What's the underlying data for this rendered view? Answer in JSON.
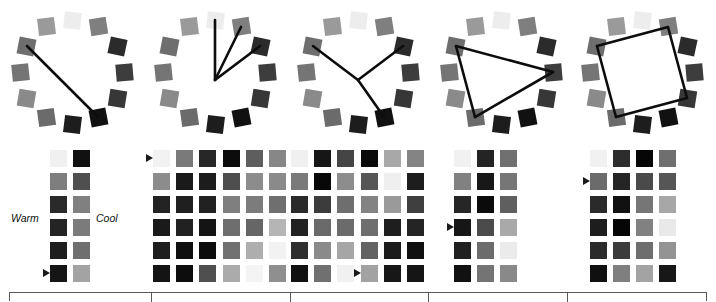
{
  "figure": {
    "background": "#ffffff",
    "line_color": "#0d0d0d",
    "marker_color": "#1a1a1a",
    "table_border_color": "#58585a"
  },
  "labels": {
    "warm": "Warm",
    "cool": "Cool"
  },
  "chart_data": {
    "type": "table",
    "panels": [
      {
        "name": "panel-1-complementary",
        "x": 0,
        "dial": {
          "center_x": 72,
          "center_y": 72,
          "radius": 52,
          "swatch_count": 12,
          "swatch_values": [
            "#ededed",
            "#7f7f7f",
            "#2b2b2b",
            "#3d3d3d",
            "#373737",
            "#111111",
            "#1d1d1d",
            "#6b6b6b",
            "#8a8a8a",
            "#757575",
            "#6e6e6e",
            "#9a9a9a"
          ],
          "swatch_rotations": [
            6,
            -9,
            12,
            -5,
            9,
            -11,
            7,
            -8,
            10,
            -6,
            11,
            -7
          ],
          "lines": [
            [
              10,
              5
            ]
          ]
        },
        "groups": [
          {
            "x": 50,
            "cols": 2,
            "rows": 6,
            "values": [
              [
                "#f0f0f0",
                "#111111"
              ],
              [
                "#7e7e7e",
                "#4f4f4f"
              ],
              [
                "#2a2a2a",
                "#808080"
              ],
              [
                "#242424",
                "#7b7b7b"
              ],
              [
                "#1e1e1e",
                "#6f6f6f"
              ],
              [
                "#151515",
                "#a3a3a3"
              ]
            ],
            "marker": {
              "row": 5,
              "col": 0
            }
          }
        ],
        "warm_label_pos": {
          "x": 11,
          "y": 212
        },
        "cool_label_pos": {
          "x": 96,
          "y": 212
        }
      },
      {
        "name": "panel-2-split",
        "x": 143,
        "dial": {
          "center_x": 72,
          "center_y": 72,
          "radius": 52,
          "swatch_count": 12,
          "swatch_values": [
            "#ededed",
            "#7f7f7f",
            "#2b2b2b",
            "#3d3d3d",
            "#373737",
            "#111111",
            "#1d1d1d",
            "#6b6b6b",
            "#8a8a8a",
            "#757575",
            "#6e6e6e",
            "#9a9a9a"
          ],
          "swatch_rotations": [
            6,
            -9,
            12,
            -5,
            9,
            -11,
            7,
            -8,
            10,
            -6,
            11,
            -7
          ],
          "lines": [
            [
              0,
              6
            ],
            [
              1,
              6
            ],
            [
              2,
              6
            ]
          ]
        },
        "groups": [
          {
            "x": 10,
            "cols": 3,
            "rows": 6,
            "values": [
              [
                "#f2f2f2",
                "#7a7a7a",
                "#272727"
              ],
              [
                "#8c8c8c",
                "#1a1a1a",
                "#1c1c1c"
              ],
              [
                "#232323",
                "#1f1f1f",
                "#212121"
              ],
              [
                "#1a1a1a",
                "#212121",
                "#141414"
              ],
              [
                "#1e1e1e",
                "#0f0f0f",
                "#0c0c0c"
              ],
              [
                "#141414",
                "#0d0d0d",
                "#4f4f4f"
              ]
            ],
            "marker": {
              "row": 0,
              "col": 0
            }
          },
          {
            "x": 80,
            "cols": 3,
            "rows": 6,
            "values": [
              [
                "#0c0c0c",
                "#5e5e5e",
                "#878787"
              ],
              [
                "#4e4e4e",
                "#8c8c8c",
                "#8a8a8a"
              ],
              [
                "#7f7f7f",
                "#7c7c7c",
                "#6f6f6f"
              ],
              [
                "#6e6e6e",
                "#666666",
                "#b5b5b5"
              ],
              [
                "#717171",
                "#aeaeae",
                "#f2f2f2"
              ],
              [
                "#ababab",
                "#f4f4f4",
                "#8f8f8f"
              ]
            ],
            "marker": null
          }
        ]
      },
      {
        "name": "panel-3-triad-y",
        "x": 286,
        "dial": {
          "center_x": 72,
          "center_y": 72,
          "radius": 52,
          "swatch_count": 12,
          "swatch_values": [
            "#ededed",
            "#7f7f7f",
            "#2b2b2b",
            "#3d3d3d",
            "#373737",
            "#111111",
            "#1d1d1d",
            "#6b6b6b",
            "#8a8a8a",
            "#757575",
            "#6e6e6e",
            "#9a9a9a"
          ],
          "swatch_rotations": [
            6,
            -9,
            12,
            -5,
            9,
            -11,
            7,
            -8,
            10,
            -6,
            11,
            -7
          ],
          "lines": [
            [
              10,
              95
            ],
            [
              5,
              95
            ],
            [
              2,
              95
            ]
          ]
        },
        "groups": [
          {
            "x": 5,
            "cols": 3,
            "rows": 6,
            "values": [
              [
                "#f0f0f0",
                "#161616",
                "#454545"
              ],
              [
                "#7a7a7a",
                "#080808",
                "#8d8d8d"
              ],
              [
                "#2a2a2a",
                "#3c3c3c",
                "#6e6e6e"
              ],
              [
                "#222222",
                "#6a6a6a",
                "#6b6b6b"
              ],
              [
                "#2e2e2e",
                "#8a8a8a",
                "#a6a6a6"
              ],
              [
                "#111111",
                "#707070",
                "#f1f1f1"
              ]
            ],
            "marker": null
          },
          {
            "x": 75,
            "cols": 3,
            "rows": 6,
            "values": [
              [
                "#0a0a0a",
                "#a8a8a8",
                "#848484"
              ],
              [
                "#565656",
                "#efefef",
                "#1d1d1d"
              ],
              [
                "#838383",
                "#9a9a9a",
                "#3f3f3f"
              ],
              [
                "#6e6e6e",
                "#1e1e1e",
                "#242424"
              ],
              [
                "#636363",
                "#1b1b1b",
                "#101010"
              ],
              [
                "#a2a2a2",
                "#171717",
                "#151515"
              ]
            ],
            "marker": {
              "row": 5,
              "col": 0
            }
          }
        ]
      },
      {
        "name": "panel-4-triangle",
        "x": 429,
        "dial": {
          "center_x": 72,
          "center_y": 72,
          "radius": 52,
          "swatch_count": 12,
          "swatch_values": [
            "#ededed",
            "#7f7f7f",
            "#2b2b2b",
            "#3d3d3d",
            "#373737",
            "#111111",
            "#1d1d1d",
            "#6b6b6b",
            "#8a8a8a",
            "#757575",
            "#6e6e6e",
            "#9a9a9a"
          ],
          "swatch_rotations": [
            6,
            -9,
            12,
            -5,
            9,
            -11,
            7,
            -8,
            10,
            -6,
            11,
            -7
          ],
          "lines": [
            [
              10,
              3
            ],
            [
              3,
              7
            ],
            [
              7,
              10
            ]
          ]
        },
        "groups": [
          {
            "x": 25,
            "cols": 3,
            "rows": 6,
            "values": [
              [
                "#f1f1f1",
                "#242424",
                "#707070"
              ],
              [
                "#818181",
                "#181818",
                "#767676"
              ],
              [
                "#262626",
                "#0b0b0b",
                "#5f5f5f"
              ],
              [
                "#161616",
                "#4b4b4b",
                "#a9a9a9"
              ],
              [
                "#202020",
                "#6c6c6c",
                "#ebebeb"
              ],
              [
                "#111111",
                "#747474",
                "#898989"
              ]
            ],
            "marker": {
              "row": 3,
              "col": 0
            }
          }
        ]
      },
      {
        "name": "panel-5-tetrad",
        "x": 572,
        "dial": {
          "center_x": 70,
          "center_y": 72,
          "radius": 52,
          "swatch_count": 12,
          "swatch_values": [
            "#ededed",
            "#7f7f7f",
            "#2b2b2b",
            "#3d3d3d",
            "#373737",
            "#111111",
            "#1d1d1d",
            "#6b6b6b",
            "#8a8a8a",
            "#757575",
            "#6e6e6e",
            "#9a9a9a"
          ],
          "swatch_rotations": [
            6,
            -9,
            12,
            -5,
            9,
            -11,
            7,
            -8,
            10,
            -6,
            11,
            -7
          ],
          "lines": [
            [
              1,
              4
            ],
            [
              4,
              7
            ],
            [
              7,
              10
            ],
            [
              10,
              1
            ]
          ]
        },
        "groups": [
          {
            "x": 18,
            "cols": 4,
            "rows": 6,
            "values": [
              [
                "#f1f1f1",
                "#2d2d2d",
                "#060606",
                "#6f6f6f"
              ],
              [
                "#6b6b6b",
                "#252525",
                "#4a4a4a",
                "#565656"
              ],
              [
                "#2a2a2a",
                "#111111",
                "#767676",
                "#a7a7a7"
              ],
              [
                "#1d1d1d",
                "#060606",
                "#818181",
                "#e9e9e9"
              ],
              [
                "#2b2b2b",
                "#3b3b3b",
                "#6e6e6e",
                "#939393"
              ],
              [
                "#101010",
                "#7f7f7f",
                "#a3a3a3",
                "#171717"
              ]
            ],
            "marker": {
              "row": 1,
              "col": 0
            }
          }
        ]
      }
    ],
    "table": {
      "left": 9,
      "top": 292,
      "width": 698,
      "dividers": [
        141,
        280,
        418,
        557
      ]
    }
  }
}
